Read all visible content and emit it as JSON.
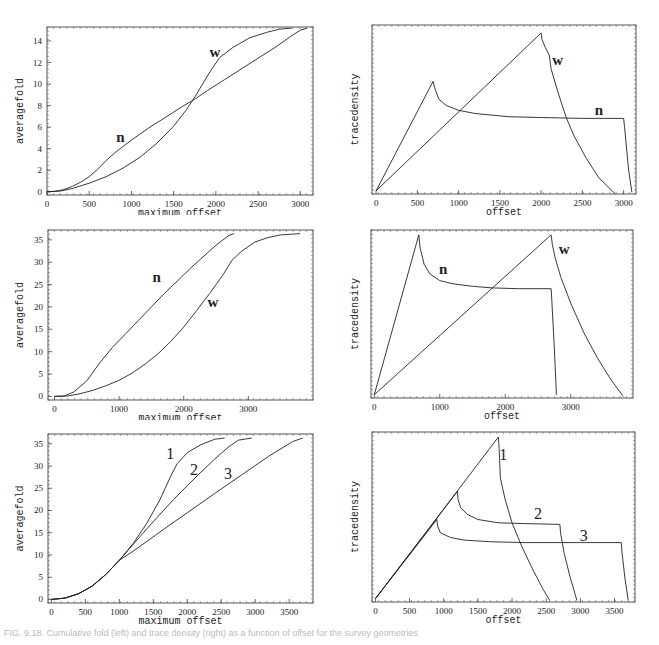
{
  "figure": {
    "caption": "FIG. 9.18. Cumulative fold (left) and trace density (right) as a function of offset for the survey geometries"
  },
  "chart_data": [
    {
      "id": "top-left",
      "type": "line",
      "xlabel": "maximum offset",
      "ylabel": "averagefold",
      "xlim": [
        0,
        3150
      ],
      "ylim": [
        -0.3,
        15.3
      ],
      "xticks": [
        0,
        500,
        1000,
        1500,
        2000,
        2500,
        3000
      ],
      "yticks": [
        0,
        2,
        4,
        6,
        8,
        10,
        12,
        14
      ],
      "grid": false,
      "series": [
        {
          "name": "n",
          "label_pos": [
            870,
            4.6
          ],
          "points": [
            [
              0,
              0
            ],
            [
              100,
              0.05
            ],
            [
              200,
              0.2
            ],
            [
              300,
              0.5
            ],
            [
              400,
              0.9
            ],
            [
              500,
              1.4
            ],
            [
              600,
              2.1
            ],
            [
              700,
              2.9
            ],
            [
              800,
              3.6
            ],
            [
              900,
              4.2
            ],
            [
              1000,
              4.8
            ],
            [
              1200,
              5.9
            ],
            [
              1400,
              6.9
            ],
            [
              1600,
              7.9
            ],
            [
              1750,
              8.6
            ],
            [
              1900,
              9.4
            ],
            [
              2100,
              10.4
            ],
            [
              2300,
              11.4
            ],
            [
              2500,
              12.4
            ],
            [
              2700,
              13.4
            ],
            [
              2900,
              14.5
            ],
            [
              3000,
              15.0
            ],
            [
              3080,
              15.2
            ]
          ]
        },
        {
          "name": "w",
          "label_pos": [
            1990,
            12.5
          ],
          "points": [
            [
              0,
              0
            ],
            [
              150,
              0.05
            ],
            [
              300,
              0.3
            ],
            [
              500,
              0.8
            ],
            [
              700,
              1.4
            ],
            [
              900,
              2.2
            ],
            [
              1100,
              3.2
            ],
            [
              1300,
              4.5
            ],
            [
              1500,
              6.1
            ],
            [
              1650,
              7.6
            ],
            [
              1750,
              8.8
            ],
            [
              1850,
              10.1
            ],
            [
              1950,
              11.4
            ],
            [
              2050,
              12.5
            ],
            [
              2200,
              13.4
            ],
            [
              2400,
              14.3
            ],
            [
              2600,
              14.8
            ],
            [
              2750,
              15.1
            ],
            [
              2900,
              15.2
            ]
          ]
        }
      ]
    },
    {
      "id": "top-right",
      "type": "line",
      "xlabel": "offset",
      "ylabel": "tracedensity",
      "xlim": [
        -50,
        3150
      ],
      "ylim": [
        0,
        1.05
      ],
      "xticks": [
        0,
        500,
        1000,
        1500,
        2000,
        2500,
        3000
      ],
      "yticks": [],
      "grid": false,
      "series": [
        {
          "name": "n",
          "label_pos": [
            2700,
            0.49
          ],
          "points": [
            [
              0,
              0.02
            ],
            [
              690,
              0.7
            ],
            [
              710,
              0.66
            ],
            [
              760,
              0.59
            ],
            [
              850,
              0.55
            ],
            [
              1000,
              0.52
            ],
            [
              1200,
              0.5
            ],
            [
              1600,
              0.48
            ],
            [
              2000,
              0.475
            ],
            [
              2500,
              0.47
            ],
            [
              3000,
              0.47
            ],
            [
              3010,
              0.42
            ],
            [
              3060,
              0.15
            ],
            [
              3100,
              0.01
            ]
          ]
        },
        {
          "name": "w",
          "label_pos": [
            2200,
            0.8
          ],
          "points": [
            [
              0,
              0.02
            ],
            [
              2000,
              1.0
            ],
            [
              2010,
              0.96
            ],
            [
              2050,
              0.91
            ],
            [
              2100,
              0.86
            ],
            [
              2120,
              0.78
            ],
            [
              2200,
              0.64
            ],
            [
              2300,
              0.48
            ],
            [
              2400,
              0.36
            ],
            [
              2550,
              0.22
            ],
            [
              2700,
              0.1
            ],
            [
              2900,
              0.0
            ]
          ]
        }
      ]
    },
    {
      "id": "middle-left",
      "type": "line",
      "xlabel": "maximum offset",
      "ylabel": "averagefold",
      "xlim": [
        -100,
        4000
      ],
      "ylim": [
        -0.8,
        37.2
      ],
      "xticks": [
        0,
        1000,
        2000,
        3000
      ],
      "yticks": [
        0,
        5,
        10,
        15,
        20,
        25,
        30,
        35
      ],
      "grid": false,
      "series": [
        {
          "name": "n",
          "label_pos": [
            1580,
            25.5
          ],
          "points": [
            [
              0,
              0
            ],
            [
              150,
              0.1
            ],
            [
              300,
              1.0
            ],
            [
              500,
              3.5
            ],
            [
              700,
              7.5
            ],
            [
              900,
              11.0
            ],
            [
              1100,
              14.0
            ],
            [
              1300,
              17.0
            ],
            [
              1500,
              20.0
            ],
            [
              1700,
              23.0
            ],
            [
              1900,
              25.8
            ],
            [
              2100,
              28.6
            ],
            [
              2300,
              31.2
            ],
            [
              2500,
              33.8
            ],
            [
              2700,
              36.0
            ],
            [
              2780,
              36.4
            ]
          ]
        },
        {
          "name": "w",
          "label_pos": [
            2450,
            20.0
          ],
          "points": [
            [
              0,
              0
            ],
            [
              200,
              0.1
            ],
            [
              400,
              0.6
            ],
            [
              600,
              1.4
            ],
            [
              800,
              2.4
            ],
            [
              1000,
              3.6
            ],
            [
              1200,
              5.2
            ],
            [
              1400,
              7.2
            ],
            [
              1600,
              9.5
            ],
            [
              1800,
              12.3
            ],
            [
              2000,
              15.5
            ],
            [
              2200,
              19.2
            ],
            [
              2400,
              23.0
            ],
            [
              2600,
              27.0
            ],
            [
              2750,
              30.5
            ],
            [
              2900,
              32.5
            ],
            [
              3100,
              34.5
            ],
            [
              3300,
              35.5
            ],
            [
              3500,
              36.1
            ],
            [
              3800,
              36.4
            ]
          ]
        }
      ]
    },
    {
      "id": "middle-right",
      "type": "line",
      "xlabel": "offset",
      "ylabel": "tracedensity",
      "xlim": [
        -50,
        3950
      ],
      "ylim": [
        0,
        1.03
      ],
      "xticks": [
        0,
        1000,
        2000,
        3000
      ],
      "yticks": [],
      "grid": false,
      "series": [
        {
          "name": "n",
          "label_pos": [
            1050,
            0.76
          ],
          "points": [
            [
              0,
              0.02
            ],
            [
              680,
              1.0
            ],
            [
              700,
              0.92
            ],
            [
              760,
              0.82
            ],
            [
              850,
              0.76
            ],
            [
              1000,
              0.72
            ],
            [
              1200,
              0.7
            ],
            [
              1500,
              0.685
            ],
            [
              1800,
              0.675
            ],
            [
              2200,
              0.67
            ],
            [
              2700,
              0.67
            ],
            [
              2710,
              0.6
            ],
            [
              2750,
              0.3
            ],
            [
              2780,
              0.02
            ]
          ]
        },
        {
          "name": "w",
          "label_pos": [
            2900,
            0.88
          ],
          "points": [
            [
              0,
              0.02
            ],
            [
              2700,
              1.0
            ],
            [
              2720,
              0.94
            ],
            [
              2760,
              0.86
            ],
            [
              2850,
              0.74
            ],
            [
              3000,
              0.58
            ],
            [
              3200,
              0.4
            ],
            [
              3400,
              0.25
            ],
            [
              3600,
              0.12
            ],
            [
              3800,
              0.01
            ]
          ]
        }
      ]
    },
    {
      "id": "bottom-left",
      "type": "line",
      "xlabel": "maximum offset",
      "ylabel": "averagefold",
      "xlim": [
        -50,
        3850
      ],
      "ylim": [
        -0.8,
        37.2
      ],
      "xticks": [
        0,
        500,
        1000,
        1500,
        2000,
        2500,
        3000,
        3500
      ],
      "yticks": [
        0,
        5,
        10,
        15,
        20,
        25,
        30,
        35
      ],
      "grid": false,
      "series": [
        {
          "name": "1",
          "label_pos": [
            1750,
            31.5
          ],
          "points": [
            [
              0,
              0
            ],
            [
              200,
              0.3
            ],
            [
              400,
              1.3
            ],
            [
              600,
              3.0
            ],
            [
              800,
              5.6
            ],
            [
              1000,
              8.8
            ],
            [
              1200,
              12.5
            ],
            [
              1400,
              17.0
            ],
            [
              1600,
              22.5
            ],
            [
              1750,
              27.5
            ],
            [
              1850,
              30.5
            ],
            [
              2000,
              33.0
            ],
            [
              2200,
              34.8
            ],
            [
              2400,
              36.0
            ],
            [
              2550,
              36.3
            ]
          ]
        },
        {
          "name": "2",
          "label_pos": [
            2100,
            28.0
          ],
          "points": [
            [
              0,
              0
            ],
            [
              200,
              0.3
            ],
            [
              400,
              1.3
            ],
            [
              600,
              3.0
            ],
            [
              800,
              5.6
            ],
            [
              1000,
              8.8
            ],
            [
              1200,
              12.3
            ],
            [
              1400,
              15.8
            ],
            [
              1600,
              19.2
            ],
            [
              1800,
              22.5
            ],
            [
              2000,
              25.6
            ],
            [
              2200,
              28.6
            ],
            [
              2400,
              31.5
            ],
            [
              2600,
              34.2
            ],
            [
              2750,
              35.8
            ],
            [
              2950,
              36.3
            ]
          ]
        },
        {
          "name": "3",
          "label_pos": [
            2600,
            27.0
          ],
          "points": [
            [
              0,
              0
            ],
            [
              200,
              0.3
            ],
            [
              400,
              1.3
            ],
            [
              600,
              3.0
            ],
            [
              800,
              5.6
            ],
            [
              1000,
              8.8
            ],
            [
              1200,
              10.8
            ],
            [
              1400,
              13.0
            ],
            [
              1700,
              16.3
            ],
            [
              2000,
              19.5
            ],
            [
              2400,
              23.8
            ],
            [
              2800,
              28.0
            ],
            [
              3200,
              32.2
            ],
            [
              3550,
              35.5
            ],
            [
              3700,
              36.3
            ]
          ]
        }
      ]
    },
    {
      "id": "bottom-right",
      "type": "line",
      "xlabel": "offset",
      "ylabel": "tracedensity",
      "xlim": [
        -50,
        3800
      ],
      "ylim": [
        0,
        1.03
      ],
      "xticks": [
        0,
        500,
        1000,
        1500,
        2000,
        2500,
        3000,
        3500
      ],
      "yticks": [],
      "grid": false,
      "series": [
        {
          "name": "1",
          "label_pos": [
            1870,
            0.86
          ],
          "points": [
            [
              0,
              0.02
            ],
            [
              1800,
              1.0
            ],
            [
              1810,
              0.93
            ],
            [
              1830,
              0.75
            ],
            [
              1900,
              0.62
            ],
            [
              2000,
              0.48
            ],
            [
              2150,
              0.33
            ],
            [
              2300,
              0.2
            ],
            [
              2450,
              0.08
            ],
            [
              2550,
              0.01
            ]
          ]
        },
        {
          "name": "2",
          "label_pos": [
            2380,
            0.5
          ],
          "points": [
            [
              0,
              0.02
            ],
            [
              1200,
              0.67
            ],
            [
              1210,
              0.62
            ],
            [
              1250,
              0.57
            ],
            [
              1350,
              0.53
            ],
            [
              1500,
              0.5
            ],
            [
              1800,
              0.48
            ],
            [
              2200,
              0.475
            ],
            [
              2700,
              0.47
            ],
            [
              2710,
              0.42
            ],
            [
              2760,
              0.3
            ],
            [
              2850,
              0.15
            ],
            [
              2950,
              0.01
            ]
          ]
        },
        {
          "name": "3",
          "label_pos": [
            3050,
            0.37
          ],
          "points": [
            [
              0,
              0.02
            ],
            [
              900,
              0.5
            ],
            [
              910,
              0.46
            ],
            [
              950,
              0.42
            ],
            [
              1100,
              0.39
            ],
            [
              1300,
              0.375
            ],
            [
              1700,
              0.365
            ],
            [
              2200,
              0.36
            ],
            [
              3000,
              0.36
            ],
            [
              3600,
              0.36
            ],
            [
              3610,
              0.3
            ],
            [
              3650,
              0.15
            ],
            [
              3700,
              0.01
            ]
          ]
        }
      ]
    }
  ]
}
